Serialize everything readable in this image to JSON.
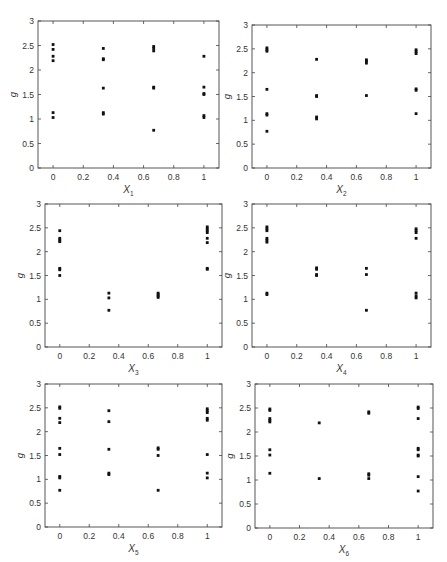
{
  "figure": {
    "ylabel": "g",
    "yticks": [
      0,
      0.5,
      1,
      1.5,
      2,
      2.5,
      3
    ],
    "ytick_labels": [
      "0",
      "0.5",
      "1",
      "1.5",
      "2",
      "2.5",
      "3"
    ],
    "xticks": [
      0,
      0.2,
      0.4,
      0.6,
      0.8,
      1
    ],
    "xtick_labels": [
      "0",
      "0.2",
      "0.4",
      "0.6",
      "0.8",
      "1"
    ],
    "xlim": [
      -0.1,
      1.1
    ],
    "ylim": [
      0,
      3
    ],
    "marker_color": "#111111",
    "axis_color": "#444444"
  },
  "chart_data": [
    {
      "type": "scatter",
      "title": "",
      "xlabel": "X",
      "xlabel_sub": "1",
      "ylabel": "g",
      "xlim": [
        -0.1,
        1.1
      ],
      "ylim": [
        0,
        3
      ],
      "grid": false,
      "points": [
        [
          0,
          2.52
        ],
        [
          0,
          2.42
        ],
        [
          0,
          2.28
        ],
        [
          0,
          2.19
        ],
        [
          0,
          1.13
        ],
        [
          0,
          1.03
        ],
        [
          0.333,
          2.44
        ],
        [
          0.333,
          2.23
        ],
        [
          0.333,
          2.21
        ],
        [
          0.333,
          1.63
        ],
        [
          0.333,
          1.13
        ],
        [
          0.333,
          1.1
        ],
        [
          0.667,
          2.48
        ],
        [
          0.667,
          2.44
        ],
        [
          0.667,
          2.39
        ],
        [
          0.667,
          1.65
        ],
        [
          0.667,
          1.63
        ],
        [
          0.667,
          0.77
        ],
        [
          1,
          2.28
        ],
        [
          1,
          1.65
        ],
        [
          1,
          1.52
        ],
        [
          1,
          1.5
        ],
        [
          1,
          1.07
        ],
        [
          1,
          1.03
        ]
      ]
    },
    {
      "type": "scatter",
      "title": "",
      "xlabel": "X",
      "xlabel_sub": "2",
      "ylabel": "g",
      "xlim": [
        -0.1,
        1.1
      ],
      "ylim": [
        0,
        3
      ],
      "grid": false,
      "points": [
        [
          0,
          2.52
        ],
        [
          0,
          2.48
        ],
        [
          0,
          2.45
        ],
        [
          0,
          1.65
        ],
        [
          0,
          1.14
        ],
        [
          0,
          1.11
        ],
        [
          0,
          0.77
        ],
        [
          0.333,
          2.28
        ],
        [
          0.333,
          1.52
        ],
        [
          0.333,
          1.5
        ],
        [
          0.333,
          1.07
        ],
        [
          0.333,
          1.03
        ],
        [
          0.667,
          2.27
        ],
        [
          0.667,
          2.24
        ],
        [
          0.667,
          2.2
        ],
        [
          0.667,
          1.52
        ],
        [
          1,
          2.48
        ],
        [
          1,
          2.44
        ],
        [
          1,
          2.4
        ],
        [
          1,
          1.66
        ],
        [
          1,
          1.63
        ],
        [
          1,
          1.14
        ]
      ]
    },
    {
      "type": "scatter",
      "title": "",
      "xlabel": "X",
      "xlabel_sub": "3",
      "ylabel": "g",
      "xlim": [
        -0.1,
        1.1
      ],
      "ylim": [
        0,
        3
      ],
      "grid": false,
      "points": [
        [
          0,
          2.44
        ],
        [
          0,
          2.28
        ],
        [
          0,
          2.24
        ],
        [
          0,
          2.21
        ],
        [
          0,
          1.65
        ],
        [
          0,
          1.62
        ],
        [
          0,
          1.5
        ],
        [
          0.333,
          1.13
        ],
        [
          0.333,
          1.03
        ],
        [
          0.333,
          0.77
        ],
        [
          0.667,
          1.13
        ],
        [
          0.667,
          1.1
        ],
        [
          0.667,
          1.07
        ],
        [
          0.667,
          1.04
        ],
        [
          1,
          2.52
        ],
        [
          1,
          2.48
        ],
        [
          1,
          2.44
        ],
        [
          1,
          2.4
        ],
        [
          1,
          2.28
        ],
        [
          1,
          2.19
        ],
        [
          1,
          1.65
        ],
        [
          1,
          1.63
        ]
      ]
    },
    {
      "type": "scatter",
      "title": "",
      "xlabel": "X",
      "xlabel_sub": "4",
      "ylabel": "g",
      "xlim": [
        -0.1,
        1.1
      ],
      "ylim": [
        0,
        3
      ],
      "grid": false,
      "points": [
        [
          0,
          2.52
        ],
        [
          0,
          2.48
        ],
        [
          0,
          2.44
        ],
        [
          0,
          2.28
        ],
        [
          0,
          2.24
        ],
        [
          0,
          2.2
        ],
        [
          0,
          1.13
        ],
        [
          0,
          1.1
        ],
        [
          0.333,
          1.66
        ],
        [
          0.333,
          1.63
        ],
        [
          0.333,
          1.52
        ],
        [
          0.333,
          1.5
        ],
        [
          0.667,
          1.65
        ],
        [
          0.667,
          1.52
        ],
        [
          0.667,
          0.77
        ],
        [
          1,
          2.48
        ],
        [
          1,
          2.44
        ],
        [
          1,
          2.4
        ],
        [
          1,
          2.28
        ],
        [
          1,
          1.13
        ],
        [
          1,
          1.07
        ],
        [
          1,
          1.03
        ]
      ]
    },
    {
      "type": "scatter",
      "title": "",
      "xlabel": "X",
      "xlabel_sub": "5",
      "ylabel": "g",
      "xlim": [
        -0.1,
        1.1
      ],
      "ylim": [
        0,
        3
      ],
      "grid": false,
      "points": [
        [
          0,
          2.52
        ],
        [
          0,
          2.49
        ],
        [
          0,
          2.28
        ],
        [
          0,
          2.19
        ],
        [
          0,
          1.65
        ],
        [
          0,
          1.52
        ],
        [
          0,
          1.06
        ],
        [
          0,
          1.03
        ],
        [
          0,
          0.77
        ],
        [
          0.333,
          2.44
        ],
        [
          0.333,
          2.21
        ],
        [
          0.333,
          1.63
        ],
        [
          0.333,
          1.13
        ],
        [
          0.333,
          1.1
        ],
        [
          0.667,
          1.66
        ],
        [
          0.667,
          1.63
        ],
        [
          0.667,
          1.5
        ],
        [
          0.667,
          0.77
        ],
        [
          1,
          2.48
        ],
        [
          1,
          2.44
        ],
        [
          1,
          2.4
        ],
        [
          1,
          2.28
        ],
        [
          1,
          2.24
        ],
        [
          1,
          1.52
        ],
        [
          1,
          1.13
        ],
        [
          1,
          1.03
        ]
      ]
    },
    {
      "type": "scatter",
      "title": "",
      "xlabel": "X",
      "xlabel_sub": "6",
      "ylabel": "g",
      "xlim": [
        -0.1,
        1.1
      ],
      "ylim": [
        0,
        3
      ],
      "grid": false,
      "points": [
        [
          0,
          2.48
        ],
        [
          0,
          2.45
        ],
        [
          0,
          2.28
        ],
        [
          0,
          2.24
        ],
        [
          0,
          2.21
        ],
        [
          0,
          1.63
        ],
        [
          0,
          1.52
        ],
        [
          0,
          1.14
        ],
        [
          0.333,
          2.19
        ],
        [
          0.333,
          1.03
        ],
        [
          0.667,
          2.42
        ],
        [
          0.667,
          2.39
        ],
        [
          0.667,
          1.13
        ],
        [
          0.667,
          1.1
        ],
        [
          0.667,
          1.03
        ],
        [
          1,
          2.52
        ],
        [
          1,
          2.49
        ],
        [
          1,
          2.28
        ],
        [
          1,
          1.66
        ],
        [
          1,
          1.63
        ],
        [
          1,
          1.52
        ],
        [
          1,
          1.5
        ],
        [
          1,
          1.07
        ],
        [
          1,
          0.77
        ]
      ]
    }
  ],
  "layout": {
    "panels": [
      {
        "left": 38,
        "top": 21,
        "width": 181,
        "height": 147
      },
      {
        "left": 252,
        "top": 25,
        "width": 179,
        "height": 143
      },
      {
        "left": 45,
        "top": 204,
        "width": 177,
        "height": 143
      },
      {
        "left": 252,
        "top": 204,
        "width": 179,
        "height": 143
      },
      {
        "left": 45,
        "top": 384,
        "width": 177,
        "height": 143
      },
      {
        "left": 255,
        "top": 384,
        "width": 178,
        "height": 144
      }
    ]
  }
}
